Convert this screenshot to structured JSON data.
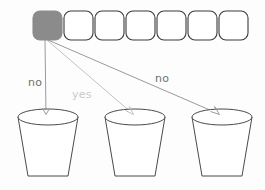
{
  "diagram": {
    "colors": {
      "filled_cell": "#8b8b8b",
      "cell_stroke": "#3a3a3a",
      "bucket_stroke": "#4a4a4a",
      "edge_dark": "#9a9a9a",
      "edge_light": "#c2c2c2",
      "label_dark": "#6f6f6f",
      "label_light": "#c9c9c9",
      "background": "#fdfdfd"
    },
    "cells": [
      {
        "index": 0,
        "state": "filled",
        "label": ""
      },
      {
        "index": 1,
        "state": "empty",
        "label": ""
      },
      {
        "index": 2,
        "state": "empty",
        "label": ""
      },
      {
        "index": 3,
        "state": "empty",
        "label": ""
      },
      {
        "index": 4,
        "state": "empty",
        "label": ""
      },
      {
        "index": 5,
        "state": "empty",
        "label": ""
      },
      {
        "index": 6,
        "state": "empty",
        "label": ""
      }
    ],
    "edges": [
      {
        "id": "edge-left",
        "label": "no",
        "tone": "dark",
        "target": "bucket-1"
      },
      {
        "id": "edge-middle",
        "label": "yes",
        "tone": "light",
        "target": "bucket-2"
      },
      {
        "id": "edge-right",
        "label": "no",
        "tone": "dark",
        "target": "bucket-3"
      }
    ],
    "buckets": [
      {
        "id": "bucket-1",
        "label": ""
      },
      {
        "id": "bucket-2",
        "label": ""
      },
      {
        "id": "bucket-3",
        "label": ""
      }
    ]
  }
}
